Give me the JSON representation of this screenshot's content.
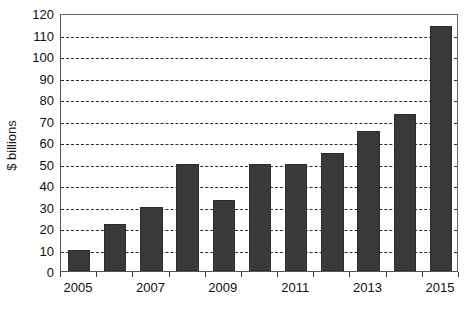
{
  "chart_data": {
    "type": "bar",
    "title": "",
    "subtitle": "",
    "xlabel": "",
    "ylabel": "$ billions",
    "categories": [
      "2005",
      "2006",
      "2007",
      "2008",
      "2009",
      "2010",
      "2011",
      "2012",
      "2013",
      "2014",
      "2015"
    ],
    "values": [
      10,
      22,
      30,
      50,
      33,
      50,
      50,
      55,
      65,
      73,
      114
    ],
    "series": [
      {
        "name": "",
        "values": [
          10,
          22,
          30,
          50,
          33,
          50,
          50,
          55,
          65,
          73,
          114
        ]
      }
    ],
    "ylim": [
      0,
      120
    ],
    "ytick_step": 10,
    "yticks": [
      0,
      10,
      20,
      30,
      40,
      50,
      60,
      70,
      80,
      90,
      100,
      110,
      120
    ],
    "ytick_labels": [
      "0",
      "10",
      "20",
      "30",
      "40",
      "50",
      "60",
      "70",
      "80",
      "90",
      "100",
      "110",
      "120"
    ],
    "xtick_labels_visible": [
      "2005",
      "2007",
      "2009",
      "2011",
      "2013",
      "2015"
    ],
    "xtick_label_indices": [
      0,
      2,
      4,
      6,
      8,
      10
    ],
    "grid": "horizontal-dashed",
    "legend": "none",
    "bar_color": "#393939",
    "grid_color": "#2b2b2b",
    "axis_color": "#555555",
    "background_color": "#ffffff"
  }
}
